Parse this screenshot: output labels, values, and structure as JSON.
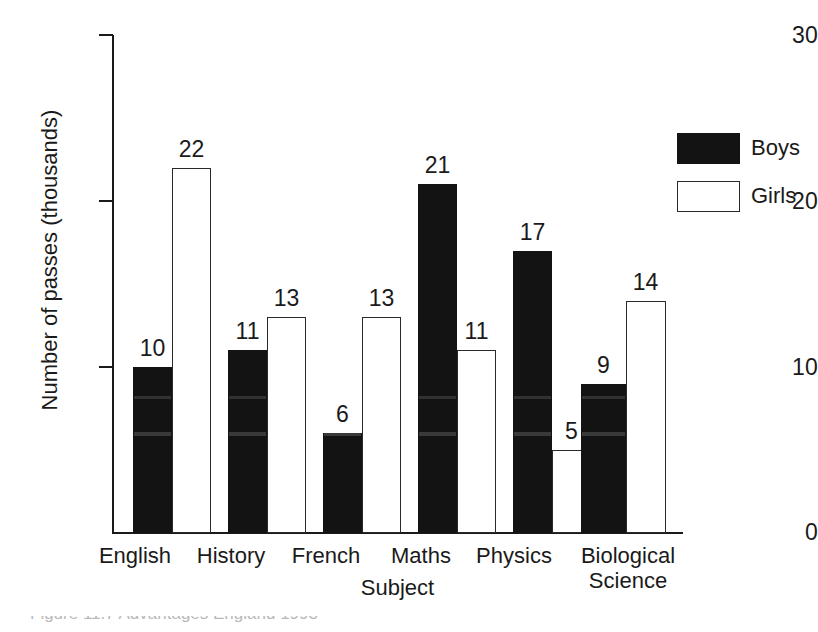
{
  "chart_data": {
    "type": "bar",
    "title": "",
    "xlabel": "Subject",
    "ylabel": "Number of passes (thousands)",
    "categories": [
      "English",
      "History",
      "French",
      "Maths",
      "Physics",
      "Biological Science"
    ],
    "series": [
      {
        "name": "Boys",
        "color": "#131313",
        "values": [
          10,
          11,
          6,
          21,
          17,
          9
        ]
      },
      {
        "name": "Girls",
        "color": "#ffffff",
        "values": [
          22,
          13,
          13,
          11,
          5,
          14
        ]
      }
    ],
    "ylim": [
      0,
      30
    ],
    "yticks": [
      0,
      10,
      20,
      30
    ],
    "ytick_labels": [
      "0",
      "10",
      "20",
      "30"
    ],
    "grid": false,
    "legend_position": "top-right",
    "data_labels": true
  },
  "axes": {
    "y_title": "Number of passes (thousands)",
    "x_title": "Subject",
    "y_tick_labels": [
      "30",
      "20",
      "10",
      "0"
    ]
  },
  "legend": {
    "items": [
      {
        "label": "Boys",
        "swatch": "filled-black"
      },
      {
        "label": "Girls",
        "swatch": "outlined-white"
      }
    ]
  },
  "groups": [
    {
      "label": "English",
      "label_line1": "English",
      "label_line2": "",
      "boys": "10",
      "girls": "22"
    },
    {
      "label": "History",
      "label_line1": "History",
      "label_line2": "",
      "boys": "11",
      "girls": "13"
    },
    {
      "label": "French",
      "label_line1": "French",
      "label_line2": "",
      "boys": "6",
      "girls": "13"
    },
    {
      "label": "Maths",
      "label_line1": "Maths",
      "label_line2": "",
      "boys": "21",
      "girls": "11"
    },
    {
      "label": "Physics",
      "label_line1": "Physics",
      "label_line2": "",
      "boys": "17",
      "girls": "5"
    },
    {
      "label": "Biological Science",
      "label_line1": "Biological",
      "label_line2": "Science",
      "boys": "9",
      "girls": "14"
    }
  ],
  "caption": {
    "text": "Figure 11.7   Advantages   England 1993"
  }
}
